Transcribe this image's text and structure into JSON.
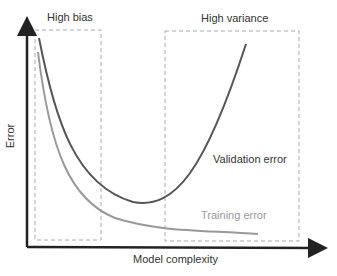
{
  "diagram": {
    "axes": {
      "x_label": "Model complexity",
      "y_label": "Error"
    },
    "regions": [
      {
        "label": "High bias"
      },
      {
        "label": "High variance"
      }
    ],
    "curves": [
      {
        "label": "Validation error",
        "color": "#555555"
      },
      {
        "label": "Training error",
        "color": "#999999"
      }
    ]
  }
}
